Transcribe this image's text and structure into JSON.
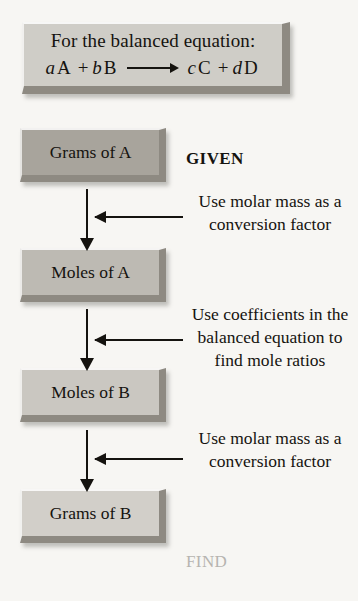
{
  "header": {
    "line1": "For the balanced equation:",
    "equation": {
      "coef_a": "a",
      "species_a": "A",
      "plus1": "+",
      "coef_b": "b",
      "species_b": "B",
      "coef_c": "c",
      "species_c": "C",
      "plus2": "+",
      "coef_d": "d",
      "species_d": "D",
      "arrow_icon": "reaction-arrow"
    }
  },
  "flow": {
    "steps": [
      {
        "label": "Grams of A",
        "fill": "#a8a49c"
      },
      {
        "label": "Moles of A",
        "fill": "#bdbab3"
      },
      {
        "label": "Moles of B",
        "fill": "#cac7c1"
      },
      {
        "label": "Grams of B",
        "fill": "#d2cfc9"
      }
    ]
  },
  "annotations": {
    "given": "GIVEN",
    "find": "FIND",
    "step1": "Use molar mass as a conversion factor",
    "step2": "Use coefficients in the balanced equation to find mole ratios",
    "step3": "Use molar mass as a conversion factor"
  },
  "colors": {
    "background": "#f7f6f3",
    "ink": "#15130f",
    "bevel_shadow": "#8e8a82",
    "faded_text": "#b6b4b0"
  }
}
